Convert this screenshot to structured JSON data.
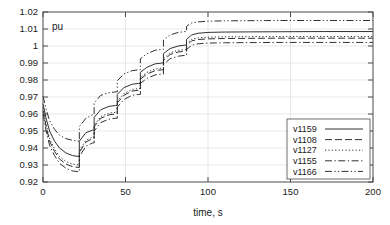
{
  "chart_data": {
    "type": "line",
    "title": "",
    "xlabel": "time, s",
    "ylabel": "pu",
    "unit_annotation": "pu",
    "xlim": [
      0,
      200
    ],
    "ylim": [
      0.92,
      1.02
    ],
    "xticks": [
      0,
      50,
      100,
      150,
      200
    ],
    "xtick_labels": [
      "0",
      "50",
      "100",
      "150",
      "200"
    ],
    "yticks": [
      0.92,
      0.93,
      0.94,
      0.95,
      0.96,
      0.97,
      0.98,
      0.99,
      1.0,
      1.01,
      1.02
    ],
    "ytick_labels": [
      "0.92",
      "0.93",
      "0.94",
      "0.95",
      "0.96",
      "0.97",
      "0.98",
      "0.99",
      "1",
      "1.01",
      "1.02"
    ],
    "grid": true,
    "legend_position": "lower-right",
    "step_times": [
      22,
      31,
      45,
      59,
      73,
      87,
      90
    ],
    "series": [
      {
        "name": "v1159",
        "style": "solid",
        "x": [
          0,
          2,
          4,
          7,
          10,
          14,
          18,
          22,
          22,
          26,
          30,
          31,
          31,
          35,
          40,
          44,
          45,
          45,
          49,
          54,
          58,
          59,
          59,
          63,
          68,
          72,
          73,
          73,
          77,
          82,
          86,
          87,
          87,
          89,
          90,
          90,
          94,
          100,
          110,
          125,
          145,
          170,
          200
        ],
        "y": [
          0.966,
          0.957,
          0.95,
          0.944,
          0.94,
          0.937,
          0.9355,
          0.935,
          0.944,
          0.949,
          0.9505,
          0.9505,
          0.958,
          0.9625,
          0.9645,
          0.965,
          0.965,
          0.9715,
          0.9755,
          0.9775,
          0.978,
          0.978,
          0.9845,
          0.9875,
          0.9895,
          0.99,
          0.99,
          0.9955,
          0.9985,
          1.0,
          1.0005,
          1.0005,
          1.004,
          1.0055,
          1.0065,
          1.0065,
          1.0075,
          1.008,
          1.0082,
          1.0083,
          1.0084,
          1.0085,
          1.0085
        ]
      },
      {
        "name": "v1108",
        "style": "dashed",
        "x": [
          0,
          2,
          4,
          7,
          10,
          14,
          18,
          22,
          22,
          26,
          30,
          31,
          31,
          35,
          40,
          44,
          45,
          45,
          49,
          54,
          58,
          59,
          59,
          63,
          68,
          72,
          73,
          73,
          77,
          82,
          86,
          87,
          87,
          89,
          90,
          90,
          94,
          100,
          110,
          125,
          145,
          170,
          200
        ],
        "y": [
          0.962,
          0.952,
          0.944,
          0.938,
          0.9335,
          0.9305,
          0.929,
          0.9285,
          0.9375,
          0.9435,
          0.9455,
          0.9455,
          0.9525,
          0.9575,
          0.9595,
          0.96,
          0.96,
          0.9665,
          0.971,
          0.9735,
          0.974,
          0.974,
          0.9805,
          0.9835,
          0.9855,
          0.986,
          0.986,
          0.9915,
          0.995,
          0.9965,
          0.997,
          0.997,
          1.0005,
          1.002,
          1.003,
          1.003,
          1.0038,
          1.0042,
          1.0044,
          1.0045,
          1.0046,
          1.0046,
          1.0046
        ]
      },
      {
        "name": "v1127",
        "style": "dotted",
        "x": [
          0,
          2,
          4,
          7,
          10,
          14,
          18,
          22,
          22,
          26,
          30,
          31,
          31,
          35,
          40,
          44,
          45,
          45,
          49,
          54,
          58,
          59,
          59,
          63,
          68,
          72,
          73,
          73,
          77,
          82,
          86,
          87,
          87,
          89,
          90,
          90,
          94,
          100,
          110,
          125,
          145,
          170,
          200
        ],
        "y": [
          0.9635,
          0.9535,
          0.9455,
          0.9395,
          0.935,
          0.932,
          0.9305,
          0.93,
          0.9385,
          0.9445,
          0.9465,
          0.9465,
          0.9535,
          0.9585,
          0.9605,
          0.961,
          0.961,
          0.9675,
          0.972,
          0.9745,
          0.975,
          0.975,
          0.9815,
          0.9845,
          0.9865,
          0.987,
          0.987,
          0.9925,
          0.996,
          0.9975,
          0.998,
          0.998,
          1.0015,
          1.003,
          1.004,
          1.004,
          1.0048,
          1.0052,
          1.0054,
          1.0055,
          1.0056,
          1.0056,
          1.0056
        ]
      },
      {
        "name": "v1155",
        "style": "dash-dot",
        "x": [
          0,
          2,
          4,
          7,
          10,
          14,
          18,
          22,
          22,
          26,
          30,
          31,
          31,
          35,
          40,
          44,
          45,
          45,
          49,
          54,
          58,
          59,
          59,
          63,
          68,
          72,
          73,
          73,
          77,
          82,
          86,
          87,
          87,
          89,
          90,
          90,
          94,
          100,
          110,
          125,
          145,
          170,
          200
        ],
        "y": [
          0.96,
          0.9495,
          0.9415,
          0.9355,
          0.931,
          0.928,
          0.9265,
          0.926,
          0.935,
          0.941,
          0.943,
          0.943,
          0.95,
          0.955,
          0.957,
          0.9575,
          0.9575,
          0.964,
          0.9685,
          0.971,
          0.9715,
          0.9715,
          0.978,
          0.981,
          0.983,
          0.9835,
          0.9835,
          0.989,
          0.9925,
          0.994,
          0.9945,
          0.9945,
          0.998,
          0.9995,
          1.0005,
          1.0005,
          1.0013,
          1.0017,
          1.0019,
          1.002,
          1.0021,
          1.0021,
          1.0021
        ]
      },
      {
        "name": "v1166",
        "style": "dash-dot-dot",
        "x": [
          0,
          2,
          4,
          7,
          10,
          14,
          18,
          22,
          22,
          26,
          30,
          31,
          31,
          35,
          40,
          44,
          45,
          45,
          49,
          54,
          58,
          59,
          59,
          63,
          68,
          72,
          73,
          73,
          77,
          82,
          86,
          87,
          87,
          89,
          90,
          90,
          94,
          100,
          110,
          125,
          145,
          170,
          200
        ],
        "y": [
          0.9705,
          0.9625,
          0.956,
          0.951,
          0.9475,
          0.9455,
          0.9445,
          0.944,
          0.9525,
          0.9575,
          0.9595,
          0.9595,
          0.9665,
          0.971,
          0.9725,
          0.973,
          0.973,
          0.9795,
          0.9835,
          0.9855,
          0.986,
          0.986,
          0.9925,
          0.9955,
          0.9975,
          0.998,
          0.998,
          1.0035,
          1.0065,
          1.008,
          1.0085,
          1.0085,
          1.0115,
          1.013,
          1.0135,
          1.0135,
          1.0142,
          1.0146,
          1.0148,
          1.0149,
          1.015,
          1.015,
          1.015
        ]
      }
    ]
  }
}
